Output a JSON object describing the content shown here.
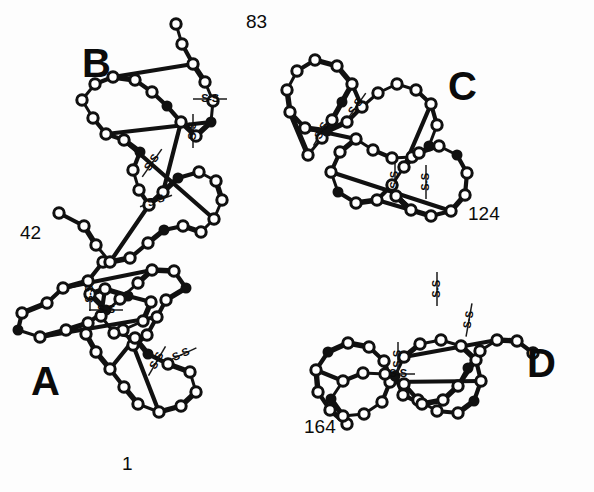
{
  "figure": {
    "type": "molecular-structure-diagram",
    "background_color": "#ffffff",
    "line_color": "#111111",
    "width": 594,
    "height": 492
  },
  "chain_labels": [
    {
      "id": "chain-b",
      "label": "B",
      "x": 82,
      "y": 77
    },
    {
      "id": "chain-c",
      "label": "C",
      "x": 448,
      "y": 100
    },
    {
      "id": "chain-a",
      "label": "A",
      "x": 31,
      "y": 395
    },
    {
      "id": "chain-d",
      "label": "D",
      "x": 527,
      "y": 377
    }
  ],
  "residue_numbers": [
    {
      "id": "residue-83",
      "label": "83",
      "x": 246,
      "y": 28
    },
    {
      "id": "residue-42",
      "label": "42",
      "x": 20,
      "y": 239
    },
    {
      "id": "residue-124",
      "label": "124",
      "x": 468,
      "y": 220
    },
    {
      "id": "residue-164",
      "label": "164",
      "x": 304,
      "y": 433
    },
    {
      "id": "residue-1",
      "label": "1",
      "x": 122,
      "y": 470
    }
  ],
  "disulfide_bonds": [
    {
      "id": "ss-1",
      "label": "S-S",
      "x": 210,
      "y": 99,
      "rotation": 0
    },
    {
      "id": "ss-2",
      "label": "S-S",
      "x": 193,
      "y": 131,
      "rotation": -90
    },
    {
      "id": "ss-3",
      "label": "S-S",
      "x": 152,
      "y": 163,
      "rotation": -55
    },
    {
      "id": "ss-4",
      "label": "S-S",
      "x": 156,
      "y": 201,
      "rotation": -20
    },
    {
      "id": "ss-5",
      "label": "S-S",
      "x": 356,
      "y": 107,
      "rotation": -55
    },
    {
      "id": "ss-6",
      "label": "S-S",
      "x": 322,
      "y": 131,
      "rotation": -60
    },
    {
      "id": "ss-7",
      "label": "S-S",
      "x": 395,
      "y": 180,
      "rotation": -90
    },
    {
      "id": "ss-8",
      "label": "S-S",
      "x": 426,
      "y": 182,
      "rotation": -90
    },
    {
      "id": "ss-9",
      "label": "S-S",
      "x": 106,
      "y": 310,
      "rotation": 0
    },
    {
      "id": "ss-10",
      "label": "S-S",
      "x": 90,
      "y": 294,
      "rotation": -90
    },
    {
      "id": "ss-11",
      "label": "S-S",
      "x": 157,
      "y": 361,
      "rotation": -60
    },
    {
      "id": "ss-12",
      "label": "S-S",
      "x": 181,
      "y": 355,
      "rotation": -25
    },
    {
      "id": "ss-13",
      "label": "S-S",
      "x": 437,
      "y": 289,
      "rotation": -90
    },
    {
      "id": "ss-14",
      "label": "S-S",
      "x": 469,
      "y": 320,
      "rotation": -80
    },
    {
      "id": "ss-15",
      "label": "S-S",
      "x": 398,
      "y": 374,
      "rotation": 0
    },
    {
      "id": "ss-16",
      "label": "S-S",
      "x": 398,
      "y": 359,
      "rotation": -90
    }
  ],
  "chain_traces": {
    "A": [
      [
        103,
        262
      ],
      [
        88,
        281
      ],
      [
        63,
        288
      ],
      [
        47,
        303
      ],
      [
        22,
        313
      ],
      [
        18,
        330
      ],
      [
        40,
        337
      ],
      [
        66,
        330
      ],
      [
        88,
        323
      ],
      [
        106,
        310
      ],
      [
        90,
        294
      ],
      [
        105,
        289
      ],
      [
        128,
        296
      ],
      [
        151,
        302
      ],
      [
        143,
        321
      ],
      [
        123,
        330
      ],
      [
        133,
        345
      ],
      [
        147,
        335
      ],
      [
        157,
        317
      ],
      [
        166,
        300
      ],
      [
        186,
        288
      ],
      [
        174,
        271
      ],
      [
        152,
        270
      ],
      [
        138,
        283
      ],
      [
        120,
        299
      ],
      [
        101,
        316
      ],
      [
        114,
        333
      ],
      [
        135,
        338
      ],
      [
        148,
        354
      ],
      [
        168,
        364
      ],
      [
        190,
        372
      ],
      [
        196,
        392
      ],
      [
        181,
        406
      ],
      [
        159,
        412
      ],
      [
        138,
        404
      ],
      [
        124,
        387
      ],
      [
        110,
        369
      ],
      [
        96,
        352
      ],
      [
        86,
        334
      ]
    ],
    "B": [
      [
        59,
        213
      ],
      [
        84,
        226
      ],
      [
        96,
        245
      ],
      [
        110,
        262
      ],
      [
        130,
        258
      ],
      [
        148,
        243
      ],
      [
        164,
        230
      ],
      [
        183,
        226
      ],
      [
        201,
        232
      ],
      [
        214,
        219
      ],
      [
        222,
        200
      ],
      [
        216,
        181
      ],
      [
        199,
        172
      ],
      [
        178,
        178
      ],
      [
        163,
        192
      ],
      [
        149,
        205
      ],
      [
        139,
        190
      ],
      [
        133,
        170
      ],
      [
        140,
        152
      ],
      [
        124,
        140
      ],
      [
        106,
        134
      ],
      [
        93,
        118
      ],
      [
        82,
        100
      ],
      [
        95,
        84
      ],
      [
        113,
        77
      ],
      [
        135,
        80
      ],
      [
        152,
        92
      ],
      [
        167,
        106
      ],
      [
        181,
        122
      ],
      [
        196,
        136
      ],
      [
        211,
        122
      ],
      [
        213,
        101
      ],
      [
        205,
        82
      ],
      [
        193,
        64
      ],
      [
        182,
        44
      ],
      [
        176,
        24
      ]
    ],
    "C": [
      [
        308,
        155
      ],
      [
        322,
        138
      ],
      [
        332,
        120
      ],
      [
        342,
        102
      ],
      [
        352,
        84
      ],
      [
        337,
        66
      ],
      [
        315,
        60
      ],
      [
        297,
        71
      ],
      [
        287,
        90
      ],
      [
        290,
        112
      ],
      [
        305,
        128
      ],
      [
        327,
        131
      ],
      [
        347,
        122
      ],
      [
        362,
        107
      ],
      [
        378,
        93
      ],
      [
        397,
        84
      ],
      [
        416,
        90
      ],
      [
        431,
        104
      ],
      [
        437,
        125
      ],
      [
        429,
        146
      ],
      [
        412,
        157
      ],
      [
        392,
        158
      ],
      [
        373,
        150
      ],
      [
        356,
        139
      ],
      [
        340,
        152
      ],
      [
        331,
        172
      ],
      [
        338,
        192
      ],
      [
        356,
        203
      ],
      [
        377,
        200
      ],
      [
        392,
        185
      ],
      [
        404,
        167
      ],
      [
        419,
        153
      ],
      [
        439,
        146
      ],
      [
        457,
        155
      ],
      [
        467,
        173
      ],
      [
        465,
        195
      ],
      [
        451,
        211
      ],
      [
        431,
        216
      ],
      [
        411,
        210
      ],
      [
        396,
        196
      ]
    ],
    "D": [
      [
        347,
        424
      ],
      [
        330,
        410
      ],
      [
        318,
        392
      ],
      [
        316,
        370
      ],
      [
        328,
        352
      ],
      [
        348,
        343
      ],
      [
        369,
        347
      ],
      [
        384,
        361
      ],
      [
        390,
        382
      ],
      [
        382,
        402
      ],
      [
        364,
        414
      ],
      [
        343,
        416
      ],
      [
        331,
        399
      ],
      [
        343,
        381
      ],
      [
        363,
        373
      ],
      [
        385,
        374
      ],
      [
        404,
        384
      ],
      [
        418,
        400
      ],
      [
        437,
        411
      ],
      [
        458,
        413
      ],
      [
        474,
        401
      ],
      [
        481,
        381
      ],
      [
        476,
        360
      ],
      [
        461,
        346
      ],
      [
        441,
        340
      ],
      [
        420,
        344
      ],
      [
        404,
        357
      ],
      [
        395,
        376
      ],
      [
        403,
        395
      ],
      [
        422,
        404
      ],
      [
        443,
        400
      ],
      [
        458,
        386
      ],
      [
        468,
        368
      ],
      [
        480,
        351
      ],
      [
        497,
        340
      ],
      [
        517,
        341
      ],
      [
        533,
        353
      ]
    ]
  },
  "legend": {
    "open_circle_meaning": "alpha-carbon residue",
    "filled_circle_meaning": "cysteine residue",
    "ss_meaning": "disulfide bridge"
  }
}
